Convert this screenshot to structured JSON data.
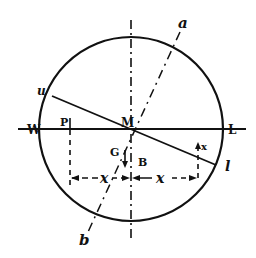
{
  "diagram": {
    "type": "geometric-construction",
    "stroke_color": "#111111",
    "background": "#ffffff"
  },
  "labels": {
    "a": "a",
    "b": "b",
    "u": "u",
    "l": "l",
    "W": "W",
    "L": "L",
    "M": "M",
    "P": "P",
    "x_top": "x",
    "G": "G",
    "B": "B",
    "dim_left": "x",
    "dim_right": "x"
  },
  "geometry": {
    "circle": {
      "cx": 131,
      "cy": 129,
      "r": 92
    },
    "horizontal_line": {
      "x1": 18,
      "y1": 129,
      "x2": 246,
      "y2": 129
    },
    "vertical_axis": {
      "x1": 131,
      "y1": 20,
      "x2": 131,
      "y2": 240
    },
    "inclined_line_ul": {
      "x1": 52,
      "y1": 96,
      "x2": 216,
      "y2": 165
    },
    "dashdot_line_ab": {
      "x1": 180,
      "y1": 32,
      "x2": 88,
      "y2": 232
    },
    "dashed_left": {
      "x1": 70,
      "y1": 129,
      "x2": 70,
      "y2": 190
    },
    "dashed_right": {
      "x1": 198,
      "y1": 146,
      "x2": 198,
      "y2": 180
    },
    "dimension_y": 178
  }
}
